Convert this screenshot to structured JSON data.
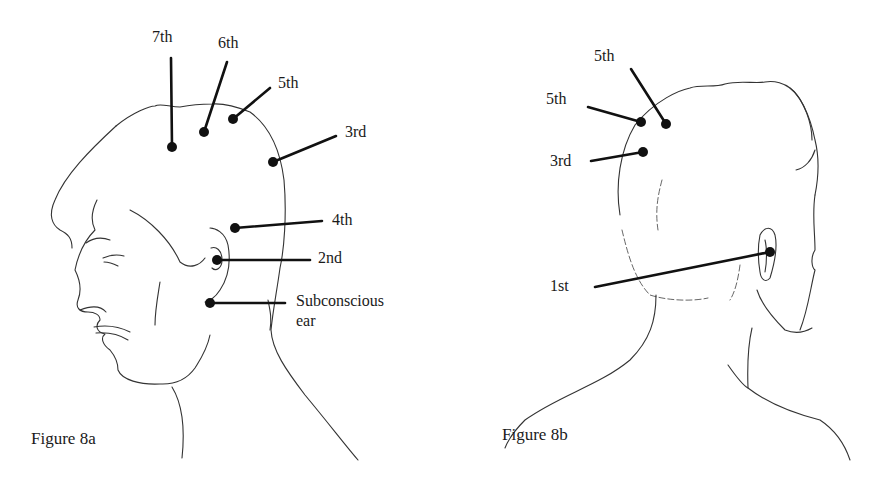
{
  "figures": [
    {
      "id": "8a",
      "caption": "Figure 8a",
      "view": "left-side profile of head",
      "points": [
        {
          "label": "7th",
          "dot": [
            172,
            147
          ],
          "line_end": [
            171,
            58
          ],
          "label_pos": [
            152,
            42
          ]
        },
        {
          "label": "6th",
          "dot": [
            204,
            132
          ],
          "line_end": [
            227,
            62
          ],
          "label_pos": [
            218,
            52
          ]
        },
        {
          "label": "5th",
          "dot": [
            233,
            119
          ],
          "line_end": [
            270,
            88
          ],
          "label_pos": [
            278,
            89
          ]
        },
        {
          "label": "3rd",
          "dot": [
            273,
            162
          ],
          "line_end": [
            336,
            136
          ],
          "label_pos": [
            345,
            138
          ]
        },
        {
          "label": "4th",
          "dot": [
            235,
            228
          ],
          "line_end": [
            322,
            221
          ],
          "label_pos": [
            332,
            226
          ]
        },
        {
          "label": "2nd",
          "dot": [
            217,
            260
          ],
          "line_end": [
            310,
            260
          ],
          "label_pos": [
            318,
            264
          ]
        },
        {
          "label": "Subconscious",
          "label2": "ear",
          "dot": [
            210,
            303
          ],
          "line_end": [
            285,
            303
          ],
          "label_pos": [
            296,
            307
          ]
        }
      ]
    },
    {
      "id": "8b",
      "caption": "Figure 8b",
      "view": "rear three-quarter view of head",
      "points": [
        {
          "label": "5th",
          "dot": [
            666,
            124
          ],
          "line_end": [
            631,
            69
          ],
          "label_pos": [
            594,
            61
          ]
        },
        {
          "label": "5th",
          "dot": [
            641,
            122
          ],
          "line_end": [
            588,
            107
          ],
          "label_pos": [
            546,
            106
          ]
        },
        {
          "label": "3rd",
          "dot": [
            643,
            152
          ],
          "line_end": [
            591,
            161
          ],
          "label_pos": [
            550,
            167
          ]
        },
        {
          "label": "1st",
          "dot": [
            770,
            252
          ],
          "line_end": [
            595,
            287
          ],
          "label_pos": [
            550,
            292
          ]
        }
      ]
    }
  ],
  "colors": {
    "ink": "#111111",
    "background": "#ffffff"
  }
}
